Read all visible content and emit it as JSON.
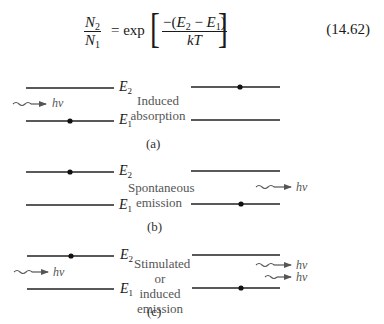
{
  "equation": {
    "lhs_num": "N",
    "lhs_num_sub": "2",
    "lhs_den": "N",
    "lhs_den_sub": "1",
    "equals_exp": "= exp",
    "rhs_num_prefix": "−(",
    "rhs_num_E2": "E",
    "rhs_num_E2_sub": "2",
    "rhs_num_minus": " − ",
    "rhs_num_E1": "E",
    "rhs_num_E1_sub": "1",
    "rhs_num_suffix": ")",
    "rhs_den": "kT",
    "left_bracket": "[",
    "right_bracket": "]",
    "number": "(14.62)"
  },
  "panels": [
    {
      "id": "a",
      "caption": "(a)",
      "description_line1": "Induced",
      "description_line2": "absorption",
      "level_upper": "E",
      "level_upper_sub": "2",
      "level_lower": "E",
      "level_lower_sub": "1",
      "photon_in": "hv",
      "photons_out": []
    },
    {
      "id": "b",
      "caption": "(b)",
      "description_line1": "Spontaneous",
      "description_line2": "emission",
      "level_upper": "E",
      "level_upper_sub": "2",
      "level_lower": "E",
      "level_lower_sub": "1",
      "photon_in": "",
      "photons_out": [
        "hv"
      ]
    },
    {
      "id": "c",
      "caption": "(c)",
      "description_line1": "Stimulated",
      "description_line2": "or induced",
      "description_line3": "emission",
      "level_upper": "E",
      "level_upper_sub": "2",
      "level_lower": "E",
      "level_lower_sub": "1",
      "photon_in": "hv",
      "photons_out": [
        "hv",
        "hv"
      ]
    }
  ],
  "colors": {
    "line": "#222222",
    "arrow": "#555555",
    "text": "#1a1a1a",
    "muted_text": "#555555"
  }
}
